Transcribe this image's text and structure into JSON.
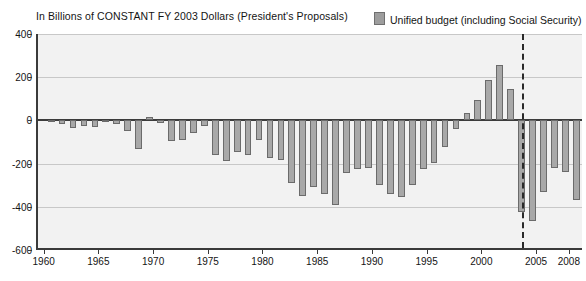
{
  "header": {
    "title": "In Billions of CONSTANT FY 2003 Dollars (President's Proposals)",
    "legend_label": "Unified budget (including Social Security)",
    "legend_swatch_color": "#9d9d9d"
  },
  "chart_data": {
    "type": "bar",
    "title": "In Billions of CONSTANT FY 2003 Dollars (President's Proposals)",
    "xlabel": "",
    "ylabel": "",
    "ylim": [
      -600,
      400
    ],
    "yticks": [
      400,
      200,
      0,
      -200,
      -400,
      -600
    ],
    "ytick_labels": [
      "400",
      "200",
      "0",
      "-200",
      "-400",
      "-600"
    ],
    "xticks": [
      1960,
      1965,
      1970,
      1975,
      1980,
      1985,
      1990,
      1995,
      2000,
      2005,
      2008
    ],
    "xtick_labels": [
      "1960",
      "1965",
      "1970",
      "1975",
      "1980",
      "1985",
      "1990",
      "1995",
      "2000",
      "2005",
      "2008"
    ],
    "xlim": [
      1959.3,
      2009.2
    ],
    "grid": true,
    "legend_position": "top-right",
    "annotations": [
      {
        "type": "vline",
        "x": 2003.5,
        "style": "dashed",
        "color": "#2a2a2a"
      }
    ],
    "series": [
      {
        "name": "Unified budget (including Social Security)",
        "color": "#a8a8a8",
        "edge_color": "#6b6b6b",
        "categories": [
          1960,
          1961,
          1962,
          1963,
          1964,
          1965,
          1966,
          1967,
          1968,
          1969,
          1970,
          1971,
          1972,
          1973,
          1974,
          1975,
          1976,
          1977,
          1978,
          1979,
          1980,
          1981,
          1982,
          1983,
          1984,
          1985,
          1986,
          1987,
          1988,
          1989,
          1990,
          1991,
          1992,
          1993,
          1994,
          1995,
          1996,
          1997,
          1998,
          1999,
          2000,
          2001,
          2002,
          2003,
          2004,
          2005,
          2006,
          2007,
          2008
        ],
        "values": [
          2,
          -19,
          -35,
          -24,
          -32,
          -9,
          -18,
          -48,
          -132,
          16,
          -13,
          -97,
          -91,
          -59,
          -26,
          -160,
          -190,
          -145,
          -162,
          -90,
          -176,
          -184,
          -290,
          -350,
          -310,
          -340,
          -390,
          -245,
          -225,
          -220,
          -300,
          -340,
          -355,
          -300,
          -225,
          -195,
          -125,
          -40,
          35,
          95,
          185,
          255,
          145,
          -425,
          -465,
          -330,
          -220,
          -240,
          -370
        ]
      }
    ]
  }
}
